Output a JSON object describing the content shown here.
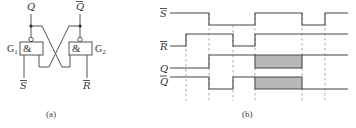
{
  "circuit": {
    "caption": "(a)",
    "gates": [
      {
        "id": "G1",
        "label": "G",
        "sub": "1",
        "symbol": "&"
      },
      {
        "id": "G2",
        "label": "G",
        "sub": "2",
        "symbol": "&"
      }
    ],
    "outputs": [
      {
        "name": "Q",
        "label": "Q",
        "overline": false
      },
      {
        "name": "Q_bar",
        "label": "Q",
        "overline": true
      }
    ],
    "inputs": [
      {
        "name": "S_bar",
        "label": "S",
        "overline": true
      },
      {
        "name": "R_bar",
        "label": "R",
        "overline": true
      }
    ]
  },
  "timing": {
    "caption": "(b)",
    "signals": [
      {
        "name": "S_bar",
        "label": "S",
        "overline": true,
        "levels": [
          "1",
          "1",
          "0",
          "0",
          "1",
          "0",
          "1"
        ]
      },
      {
        "name": "R_bar",
        "label": "R",
        "overline": true,
        "levels": [
          "0",
          "1",
          "1",
          "0",
          "1",
          "1",
          "1"
        ]
      },
      {
        "name": "Q",
        "label": "Q",
        "overline": false,
        "levels": [
          "0",
          "0",
          "1",
          "1",
          "X",
          "1",
          "1"
        ]
      },
      {
        "name": "Q_bar",
        "label": "Q",
        "overline": true,
        "levels": [
          "1",
          "1",
          "0",
          "1",
          "X",
          "0",
          "0"
        ]
      }
    ],
    "intervals": 7,
    "marker_count": 6,
    "indeterminate_fill": "#b8b8b8"
  }
}
